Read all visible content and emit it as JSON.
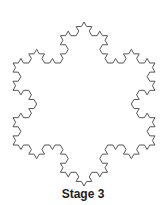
{
  "figure": {
    "caption": "Stage 3",
    "stage": 3,
    "center": [
      84,
      104
    ],
    "radius": 82,
    "stroke_color": "#555555",
    "stroke_width": 1
  }
}
